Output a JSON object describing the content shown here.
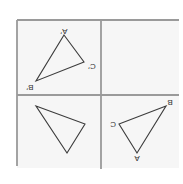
{
  "figure": {
    "orientation": "upside-down",
    "colors": {
      "axis": "#9a9a9a",
      "triangle": "#3c3c3c",
      "background": "#ffffff",
      "quadrant_fill": "#f6f6f6"
    },
    "grid": {
      "left": 17,
      "top": 20,
      "right": 179,
      "mid_x": 101,
      "mid_y": 95,
      "bottom_left": 166,
      "bottom_mid": 169
    },
    "triangles": [
      {
        "id": "image-triangle",
        "quadrant": "top-left",
        "vertices": [
          {
            "label": "A′",
            "x": 64,
            "y": 35,
            "label_x": 64,
            "label_y": 29
          },
          {
            "label": "C′",
            "x": 84,
            "y": 62,
            "label_x": 92,
            "label_y": 66
          },
          {
            "label": "B′",
            "x": 36,
            "y": 81,
            "label_x": 29,
            "label_y": 89
          }
        ]
      },
      {
        "id": "original-triangle",
        "quadrant": "bottom-right",
        "vertices": [
          {
            "label": "B",
            "x": 166,
            "y": 106,
            "label_x": 170,
            "label_y": 104
          },
          {
            "label": "C",
            "x": 119,
            "y": 124,
            "label_x": 113,
            "label_y": 127
          },
          {
            "label": "A",
            "x": 137,
            "y": 153,
            "label_x": 137,
            "label_y": 161
          }
        ]
      },
      {
        "id": "unlabeled-triangle",
        "quadrant": "bottom-left",
        "vertices": [
          {
            "label": "",
            "x": 36,
            "y": 106
          },
          {
            "label": "",
            "x": 85,
            "y": 124
          },
          {
            "label": "",
            "x": 67,
            "y": 153
          }
        ]
      }
    ],
    "labels": {
      "a_prime": "A′",
      "b_prime": "B′",
      "c_prime": "C′",
      "a": "A",
      "b": "B",
      "c": "C"
    }
  }
}
